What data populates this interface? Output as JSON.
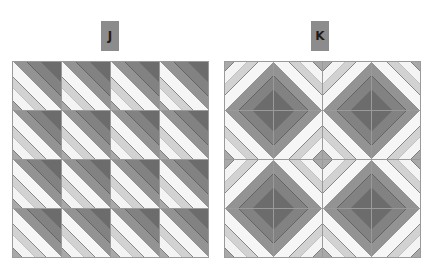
{
  "panels": [
    {
      "label": "J",
      "description": "4x4 grid of identical tiles, diagonal stripes with darkest corner at top-right",
      "rotations": [
        [
          0,
          0,
          0,
          0
        ],
        [
          0,
          0,
          0,
          0
        ],
        [
          0,
          0,
          0,
          0
        ],
        [
          0,
          0,
          0,
          0
        ]
      ]
    },
    {
      "label": "K",
      "description": "4x4 grid of the same tile rotated to form dark diamonds centered on 2x2 blocks",
      "rotations": [
        [
          90,
          180,
          90,
          180
        ],
        [
          0,
          270,
          0,
          270
        ],
        [
          90,
          180,
          90,
          180
        ],
        [
          0,
          270,
          0,
          270
        ]
      ]
    }
  ],
  "colors": {
    "label_bg": "#8c8c8c",
    "label_text": "#1e1e1e",
    "dark_stripe": "#6c6c6c",
    "light_stripe": "#f4f4f4"
  }
}
